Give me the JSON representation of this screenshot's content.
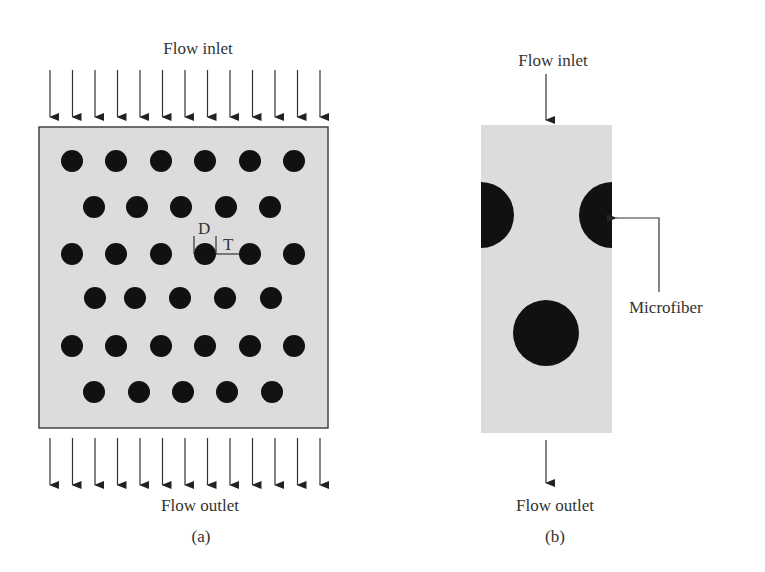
{
  "panel_a": {
    "inlet_label": "Flow inlet",
    "outlet_label": "Flow outlet",
    "caption": "(a)",
    "dim_d_label": "D",
    "dim_t_label": "T",
    "arrow_count": 13,
    "arrow_x_start": 50,
    "arrow_x_step": 22.5,
    "box": {
      "x": 39,
      "y": 127,
      "w": 289,
      "h": 301
    },
    "dot_radius": 11,
    "rows": [
      {
        "y": 161,
        "xs": [
          72,
          116,
          161,
          205,
          250,
          294
        ]
      },
      {
        "y": 207,
        "xs": [
          94,
          137,
          181,
          226,
          270
        ]
      },
      {
        "y": 254,
        "xs": [
          72,
          116,
          161,
          205,
          250,
          294
        ]
      },
      {
        "y": 298,
        "xs": [
          95,
          135,
          180,
          225,
          271
        ]
      },
      {
        "y": 346,
        "xs": [
          72,
          116,
          161,
          205,
          250,
          294
        ]
      },
      {
        "y": 392,
        "xs": [
          94,
          139,
          183,
          227,
          272
        ]
      }
    ]
  },
  "panel_b": {
    "inlet_label": "Flow inlet",
    "outlet_label": "Flow outlet",
    "caption": "(b)",
    "callout_label": "Microfiber",
    "box": {
      "x": 481,
      "y": 125,
      "w": 131,
      "h": 308
    },
    "fiber_radius": 33,
    "fibers": [
      {
        "cx": 481,
        "cy": 215
      },
      {
        "cx": 612,
        "cy": 215
      },
      {
        "cx": 546,
        "cy": 333
      }
    ]
  },
  "colors": {
    "domain_fill": "#dcdcdc",
    "fiber": "#111111",
    "line": "#333333",
    "text": "#333333"
  }
}
